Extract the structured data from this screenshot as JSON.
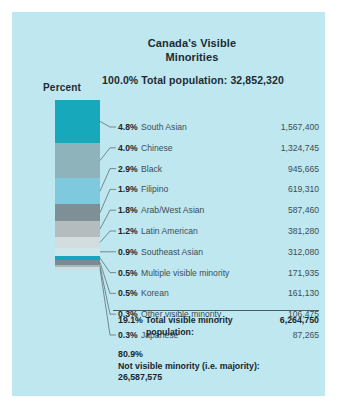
{
  "poster": {
    "background_color": "#bfe7ef",
    "title": "Canada's Visible\nMinorities",
    "title_line1": "Canada's Visible",
    "title_line2": "Minorities",
    "subtitle": "100.0% Total population: 32,852,320",
    "percent_axis_label": "Percent"
  },
  "chart_data": {
    "type": "bar",
    "title": "Canada's Visible Minorities",
    "subtitle": "100.0% Total population: 32,852,320",
    "xlabel": "",
    "ylabel": "Percent",
    "orientation": "vertical-stacked",
    "total_population": "32,852,320",
    "total_population_percent": "100.0%",
    "categories": [
      "South Asian",
      "Chinese",
      "Black",
      "Filipino",
      "Arab/West Asian",
      "Latin American",
      "Southeast Asian",
      "Multiple visible minority",
      "Korean",
      "Other visible minority",
      "Japanese"
    ],
    "values": [
      4.8,
      4.0,
      2.9,
      1.9,
      1.8,
      1.2,
      0.9,
      0.5,
      0.5,
      0.3,
      0.3
    ],
    "counts": [
      "1,567,400",
      "1,324,745",
      "945,665",
      "619,310",
      "587,460",
      "381,280",
      "312,080",
      "171,935",
      "161,130",
      "106,475",
      "87,265"
    ],
    "segment_colors": [
      "#17a8bb",
      "#8eb3bb",
      "#7ec9dd",
      "#7e8f96",
      "#b4bcbe",
      "#d3dde0",
      "#cfe6ea",
      "#16a5ba",
      "#7a8b92",
      "#aab7ba",
      "#cddfe3"
    ]
  },
  "rows": [
    {
      "percent": "4.8%",
      "name": "South Asian",
      "value": "1,567,400"
    },
    {
      "percent": "4.0%",
      "name": "Chinese",
      "value": "1,324,745"
    },
    {
      "percent": "2.9%",
      "name": "Black",
      "value": "945,665"
    },
    {
      "percent": "1.9%",
      "name": "Filipino",
      "value": "619,310"
    },
    {
      "percent": "1.8%",
      "name": "Arab/West Asian",
      "value": "587,460"
    },
    {
      "percent": "1.2%",
      "name": "Latin American",
      "value": "381,280"
    },
    {
      "percent": "0.9%",
      "name": "Southeast Asian",
      "value": "312,080"
    },
    {
      "percent": "0.5%",
      "name": "Multiple visible minority",
      "value": "171,935"
    },
    {
      "percent": "0.5%",
      "name": "Korean",
      "value": "161,130"
    },
    {
      "percent": "0.3%",
      "name": "Other visible minority",
      "value": "106,475"
    },
    {
      "percent": "0.3%",
      "name": "Japanese",
      "value": "87,265"
    }
  ],
  "total_row": {
    "percent": "19.1%",
    "label_line1": "Total visible minority",
    "label_line2": "population:",
    "value": "6,264,750"
  },
  "footer": {
    "percent": "80.9%",
    "label": "Not visible minority (i.e. majority):",
    "value": "26,587,575"
  }
}
